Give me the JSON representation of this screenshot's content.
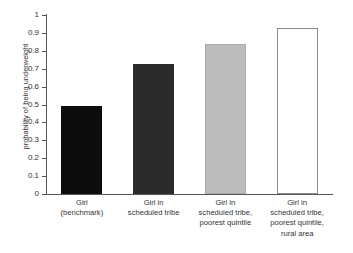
{
  "chart_data": {
    "type": "bar",
    "title": "",
    "subtitle": "",
    "xlabel": "",
    "ylabel": "probability of being underweight",
    "ylim": [
      0,
      1
    ],
    "yticks": [
      "0",
      "0.1",
      "0.2",
      "0.3",
      "0.4",
      "0.5",
      "0.6",
      "0.7",
      "0.8",
      "0.9",
      "1"
    ],
    "ytick_values": [
      0,
      0.1,
      0.2,
      0.3,
      0.4,
      0.5,
      0.6,
      0.7,
      0.8,
      0.9,
      1
    ],
    "grid": false,
    "legend": "none",
    "categories": [
      "Girl\n(benchmark)",
      "Girl in\nscheduled tribe",
      "Girl in\nscheduled tribe,\npoorest quintile",
      "Girl in\nscheduled tribe,\npoorest quintile,\nrural area"
    ],
    "category_lines": [
      [
        "Girl",
        "(benchmark)"
      ],
      [
        "Girl in",
        "scheduled tribe"
      ],
      [
        "Girl in",
        "scheduled tribe,",
        "poorest quintile"
      ],
      [
        "Girl in",
        "scheduled tribe,",
        "poorest quintile,",
        "rural area"
      ]
    ],
    "values": [
      0.49,
      0.725,
      0.84,
      0.925
    ],
    "bar_colors": [
      "#0d0d0d",
      "#2b2b2b",
      "#bcbcbc",
      "#ffffff"
    ],
    "bar_border_colors": [
      "#0d0d0d",
      "#2b2b2b",
      "#a9a9a9",
      "#8c8c8c"
    ],
    "axis_color": "#555555",
    "text_color": "#333333",
    "background": "#ffffff"
  }
}
